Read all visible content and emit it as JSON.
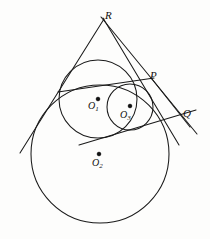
{
  "figure": {
    "background_color": "#fdfdfc",
    "ink_color": "#1a1a1a",
    "stroke_width": 1.0
  },
  "labels": {
    "apex": {
      "text": "R",
      "x": 105,
      "y": 10,
      "kind": "point"
    },
    "tangency_p": {
      "text": "P",
      "x": 150,
      "y": 70,
      "kind": "point"
    },
    "tangency_q": {
      "text": "Q",
      "x": 183,
      "y": 108,
      "kind": "point"
    },
    "center_o1": {
      "text": "O",
      "sub": "1",
      "x": 88,
      "y": 101,
      "kind": "center"
    },
    "center_o2": {
      "text": "O",
      "sub": "2",
      "x": 92,
      "y": 158,
      "kind": "center"
    },
    "center_o3": {
      "text": "O",
      "sub": "3",
      "x": 120,
      "y": 110,
      "kind": "center"
    }
  },
  "circles": [
    {
      "name": "circle-o1",
      "cx": 98,
      "cy": 99,
      "r": 39
    },
    {
      "name": "circle-o2",
      "cx": 100,
      "cy": 154,
      "r": 69
    },
    {
      "name": "circle-o3",
      "cx": 130,
      "cy": 107,
      "r": 23
    }
  ],
  "center_dots": [
    {
      "name": "center-dot-o1",
      "cx": 98,
      "cy": 99,
      "r": 1.8
    },
    {
      "name": "center-dot-o2",
      "cx": 99,
      "cy": 154,
      "r": 1.8
    },
    {
      "name": "center-dot-o3",
      "cx": 130,
      "cy": 106,
      "r": 1.8
    }
  ],
  "lines": [
    {
      "name": "tangent-left-from-R",
      "x1": 104,
      "y1": 19,
      "x2": 20,
      "y2": 153
    },
    {
      "name": "tangent-right-from-R-through-Q",
      "x1": 101,
      "y1": 17,
      "x2": 197,
      "y2": 134
    },
    {
      "name": "tangent-from-R-through-P",
      "x1": 103,
      "y1": 18,
      "x2": 179,
      "y2": 145
    },
    {
      "name": "chord-P-to-left",
      "x1": 58,
      "y1": 92,
      "x2": 154,
      "y2": 78
    },
    {
      "name": "tangent-lower-to-Q",
      "x1": 79,
      "y1": 145,
      "x2": 196,
      "y2": 110
    },
    {
      "name": "tangent-P-to-Q-lower",
      "x1": 152,
      "y1": 79,
      "x2": 190,
      "y2": 127
    }
  ],
  "annotations": {
    "description": "Circle O1 and circle O3 are internally tangent to large circle O2; lines from apex R are tangent to the circles and meet at points P and Q."
  }
}
